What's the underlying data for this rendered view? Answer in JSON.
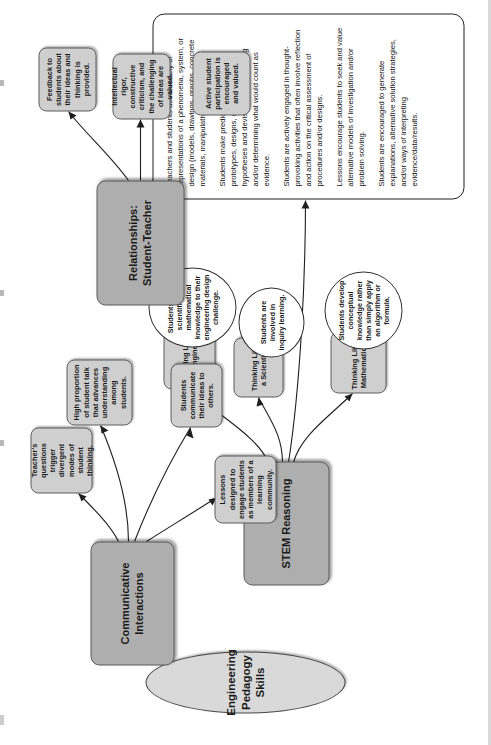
{
  "diagram": {
    "title": "Engineering Pedagogy Skills",
    "branches": [
      {
        "id": "stem-reasoning",
        "label": "STEM Reasoning",
        "indicators": [
          {
            "id": "thinking-like-a-mathematician",
            "label": "Thinking Like a Mathematician",
            "note": "Students develop conceptual knowledge rather than simply apply an algorithm or formula."
          },
          {
            "id": "thinking-like-a-scientist",
            "label": "Thinking Like a Scientist",
            "note": "Students are involved in inquiry learning."
          },
          {
            "id": "thinking-like-an-engineer",
            "label": "Thinking Like an Engineer",
            "note": "Students apply scientific and mathematical knowledge to their engineering design challenge."
          }
        ],
        "descriptors": [
          "Teachers and students use a variety of representations of a phenomena, system, or design (models, drawings, graphs, concrete materials, manipulatives, etc.).",
          "Students make predictions, conjectures, prototypes, designs, estimations, and/or hypotheses and devise means for testing and/or determining what would count as evidence.",
          "Students are actively engaged in thought-provoking activities that often involve reflection and action on the critical assessment of procedures and/or designs.",
          "Lessons encourage students to seek and value alternative models of investigation and/or problem solving.",
          "Students are encouraged to generate explanations, alternative solution strategies, and/or ways of interpreting evidence/data/results."
        ]
      },
      {
        "id": "communicative-interactions",
        "label": "Communicative Interactions",
        "indicators": [
          {
            "id": "teachers-questions",
            "label": "Teacher's questions trigger divergent modes of student thinking."
          },
          {
            "id": "high-proportion-student-talk",
            "label": "High proportion of student talk that advances understanding among students."
          },
          {
            "id": "students-communicate-ideas",
            "label": "Students communicate their ideas to others."
          },
          {
            "id": "lessons-designed-engage",
            "label": "Lessons designed to engage students as members of a learning community."
          }
        ]
      },
      {
        "id": "relationships-student-teacher",
        "label": "Relationships: Student-Teacher",
        "indicators": [
          {
            "id": "feedback-to-students",
            "label": "Feedback to students about their ideas and thinking is provided."
          },
          {
            "id": "intellectual-rigor",
            "label": "Intellectual rigor, constructive criticism, and the challenging of ideas are valued."
          },
          {
            "id": "active-student-participation",
            "label": "Active student participation is encouraged and valued."
          }
        ]
      }
    ],
    "colors": {
      "category_fill": "#aeaeae",
      "indicator_fill": "#cfcfcf",
      "title_fill": "#d9d9d9",
      "note_fill": "#ffffff",
      "stroke": "#1e1e1e"
    }
  }
}
